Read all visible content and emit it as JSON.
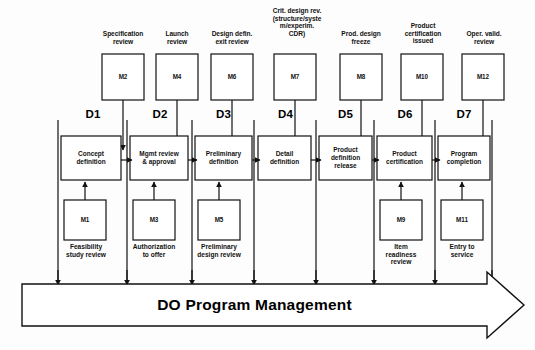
{
  "diagram": {
    "title": "DO Program Management",
    "colors": {
      "stroke": "#111111",
      "background": "#fdfdfd",
      "text": "#111111"
    },
    "phase_labels": [
      "D1",
      "D2",
      "D3",
      "D4",
      "D5",
      "D6",
      "D7"
    ],
    "top_milestones": [
      {
        "id": "M2",
        "caption": "Specification\nreview"
      },
      {
        "id": "M4",
        "caption": "Launch\nreview"
      },
      {
        "id": "M6",
        "caption": "Design defin.\nexit review"
      },
      {
        "id": "M7",
        "caption": "Crit. design rev.\n(structure/syste\nm/experim.\nCDR)"
      },
      {
        "id": "M8",
        "caption": "Prod. design\nfreeze"
      },
      {
        "id": "M10",
        "caption": "Product\ncertification\nissued"
      },
      {
        "id": "M12",
        "caption": "Oper. valid.\nreview"
      }
    ],
    "process_steps": [
      {
        "label": "Concept\ndefinition"
      },
      {
        "label": "Mgmt review\n& approval"
      },
      {
        "label": "Preliminary\ndefinition"
      },
      {
        "label": "Detail\ndefinition"
      },
      {
        "label": "Product\ndefinition\nrelease"
      },
      {
        "label": "Product\ncertification"
      },
      {
        "label": "Program\ncompletion"
      }
    ],
    "bottom_milestones": [
      {
        "id": "M1",
        "caption": "Feasibility\nstudy review"
      },
      {
        "id": "M3",
        "caption": "Authorization\nto offer"
      },
      {
        "id": "M5",
        "caption": "Preliminary\ndesign review"
      },
      {
        "id": "M9",
        "caption": "Item\nreadiness\nreview"
      },
      {
        "id": "M11",
        "caption": "Entry to\nservice"
      }
    ]
  }
}
